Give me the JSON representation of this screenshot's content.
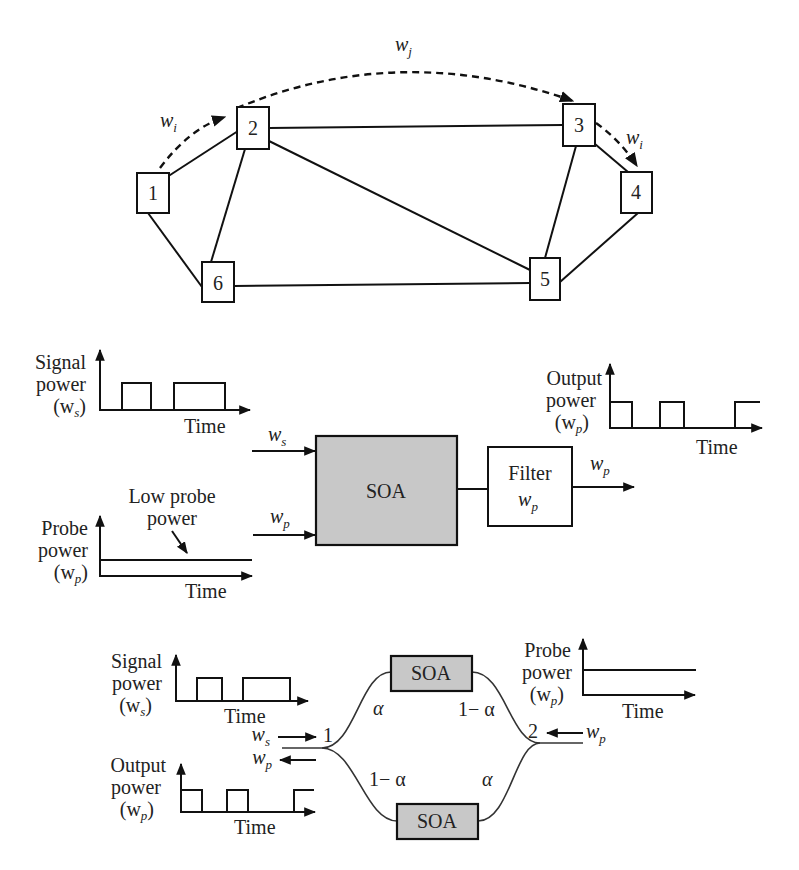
{
  "network": {
    "nodes": [
      {
        "id": "1",
        "label": "1",
        "x": 137,
        "y": 173,
        "w": 32,
        "h": 40
      },
      {
        "id": "2",
        "label": "2",
        "x": 237,
        "y": 107,
        "w": 32,
        "h": 42
      },
      {
        "id": "3",
        "label": "3",
        "x": 563,
        "y": 104,
        "w": 32,
        "h": 42
      },
      {
        "id": "4",
        "label": "4",
        "x": 621,
        "y": 172,
        "w": 31,
        "h": 41
      },
      {
        "id": "5",
        "label": "5",
        "x": 530,
        "y": 258,
        "w": 30,
        "h": 42
      },
      {
        "id": "6",
        "label": "6",
        "x": 202,
        "y": 262,
        "w": 32,
        "h": 40
      }
    ],
    "edges": [
      [
        "1",
        "2"
      ],
      [
        "1",
        "6"
      ],
      [
        "2",
        "3"
      ],
      [
        "2",
        "6"
      ],
      [
        "2",
        "5"
      ],
      [
        "3",
        "4"
      ],
      [
        "3",
        "5"
      ],
      [
        "4",
        "5"
      ],
      [
        "6",
        "5"
      ]
    ],
    "lightpath_labels": {
      "wi_left": {
        "base": "w",
        "sub": "i"
      },
      "wj_top": {
        "base": "w",
        "sub": "j"
      },
      "wi_right": {
        "base": "w",
        "sub": "i"
      }
    }
  },
  "xgm_converter": {
    "signal_plot": {
      "label_line1": "Signal",
      "label_line2": "power",
      "label_line3_base": "(w",
      "label_line3_sub": "s",
      "label_line3_close": ")",
      "xlabel": "Time"
    },
    "probe_plot": {
      "label_line1": "Probe",
      "label_line2": "power",
      "label_line3_base": "(w",
      "label_line3_sub": "p",
      "label_line3_close": ")",
      "xlabel": "Time",
      "annotation_line1": "Low probe",
      "annotation_line2": "power"
    },
    "output_plot": {
      "label_line1": "Output",
      "label_line2": "power",
      "label_line3_base": "(w",
      "label_line3_sub": "p",
      "label_line3_close": ")",
      "xlabel": "Time"
    },
    "input_ws": {
      "base": "w",
      "sub": "s"
    },
    "input_wp": {
      "base": "w",
      "sub": "p"
    },
    "soa_label": "SOA",
    "filter_label_line1": "Filter",
    "filter_label_base": "w",
    "filter_label_sub": "p",
    "output_wp": {
      "base": "w",
      "sub": "p"
    }
  },
  "xpm_converter": {
    "signal_plot": {
      "label_line1": "Signal",
      "label_line2": "power",
      "label_line3_base": "(w",
      "label_line3_sub": "s",
      "label_line3_close": ")",
      "xlabel": "Time"
    },
    "output_plot": {
      "label_line1": "Output",
      "label_line2": "power",
      "label_line3_base": "(w",
      "label_line3_sub": "p",
      "label_line3_close": ")",
      "xlabel": "Time"
    },
    "probe_plot": {
      "label_line1": "Probe",
      "label_line2": "power",
      "label_line3_base": "(w",
      "label_line3_sub": "p",
      "label_line3_close": ")",
      "xlabel": "Time"
    },
    "soa_top_label": "SOA",
    "soa_bottom_label": "SOA",
    "port1_label": "1",
    "port2_label": "2",
    "alpha": "α",
    "one_minus_alpha": "1− α",
    "ws_in": {
      "base": "w",
      "sub": "s"
    },
    "wp_out": {
      "base": "w",
      "sub": "p"
    },
    "wp_in": {
      "base": "w",
      "sub": "p"
    }
  }
}
